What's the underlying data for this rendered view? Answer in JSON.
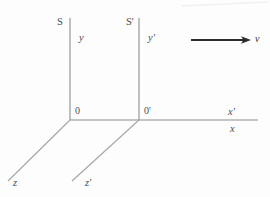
{
  "figure": {
    "background_color": "#fdfdfd",
    "line_color": "#8c8c8c",
    "arrow_color": "#2b2b2b",
    "text_color": "#4d4d4d",
    "width": 270,
    "height": 197
  },
  "frames": [
    {
      "id": "S",
      "name_label": "S",
      "origin_label": "0",
      "y_axis_label": "y",
      "x_axis_label": "x",
      "z_axis_label": "z"
    },
    {
      "id": "Sprime",
      "name_label": "S'",
      "origin_label": "0'",
      "y_axis_label": "y'",
      "x_axis_label": "x'",
      "z_axis_label": "z'"
    }
  ],
  "labels": {
    "frame_S": "S",
    "frame_Sprime": "S'",
    "y": "y",
    "y_prime": "y'",
    "origin_O": "0",
    "origin_O_prime": "0'",
    "x": "x",
    "x_prime": "x'",
    "z": "z",
    "z_prime": "z'",
    "velocity": "v"
  },
  "geometry": {
    "origin_S": {
      "x": 70,
      "y": 120
    },
    "origin_Sprime": {
      "x": 139,
      "y": 120
    },
    "y_axis_top": 18,
    "x_axis_right": 258,
    "z_end_S": {
      "x": 8,
      "y": 181
    },
    "z_end_Sprime": {
      "x": 72,
      "y": 181
    },
    "velocity_arrow": {
      "x1": 191,
      "y1": 40,
      "x2": 250,
      "y2": 40
    }
  },
  "velocity_vector": {
    "label": "v",
    "direction": "positive-x",
    "description": "Frame S' moves with velocity v along the common x-axis relative to frame S"
  }
}
